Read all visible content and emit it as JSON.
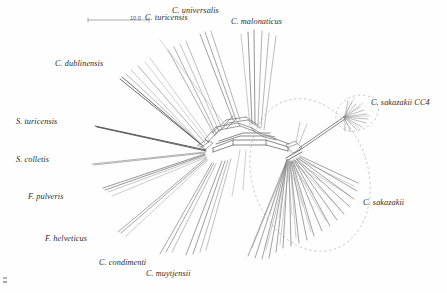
{
  "figure": {
    "kind": "phylogenetic-network",
    "method": "NeighborNet split network",
    "background": "#fefefe",
    "edge_color": "#3a3a3a",
    "highlight_color": "#b9b9b9"
  },
  "scale_bar": {
    "label": "10.0",
    "x1": 88,
    "y1": 20,
    "x2": 150,
    "y2": 20
  },
  "labels": [
    {
      "name": "c-turicensis",
      "text": "C. turicensis",
      "x": 145,
      "y": 13,
      "size": 8.2
    },
    {
      "name": "c-universalis",
      "text": "C. universalis",
      "x": 172,
      "y": 6,
      "size": 8.2
    },
    {
      "name": "c-malonaticus",
      "text": "C. malonaticus",
      "x": 231,
      "y": 17,
      "size": 8.2
    },
    {
      "name": "c-dublinensis",
      "text": "C. dublinensis",
      "x": 55,
      "y": 59,
      "size": 8.2
    },
    {
      "name": "s-turicensis",
      "text": "S. turicensis",
      "x": 16,
      "y": 117,
      "size": 8.2
    },
    {
      "name": "s-colletis",
      "text": "S. colletis",
      "x": 16,
      "y": 155,
      "size": 8.2
    },
    {
      "name": "f-pulveris",
      "text": "F. pulveris",
      "x": 28,
      "y": 192,
      "size": 8.2
    },
    {
      "name": "f-helveticus",
      "text": "F. helveticus",
      "x": 45,
      "y": 234,
      "size": 8.2
    },
    {
      "name": "c-condimenti",
      "text": "C. condimenti",
      "x": 99,
      "y": 258,
      "size": 8.2
    },
    {
      "name": "c-muytjensii",
      "text": "C. muytjensii",
      "x": 146,
      "y": 269,
      "size": 8.2
    },
    {
      "name": "c-sakazakii-cc4",
      "text": "C. sakazakii CC4",
      "x": 371,
      "y": 98,
      "size": 8.2
    },
    {
      "name": "c-sakazakii",
      "text": "C. sakazakii",
      "x": 363,
      "y": 198,
      "size": 8.2
    }
  ],
  "highlight_ellipses": [
    {
      "name": "c-sakazakii-cluster",
      "cx": 310,
      "cy": 175,
      "rx": 58,
      "ry": 78,
      "rotate": -18
    },
    {
      "name": "c-sakazakii-cc4-cluster",
      "cx": 357,
      "cy": 113,
      "rx": 22,
      "ry": 17,
      "rotate": -25
    }
  ]
}
